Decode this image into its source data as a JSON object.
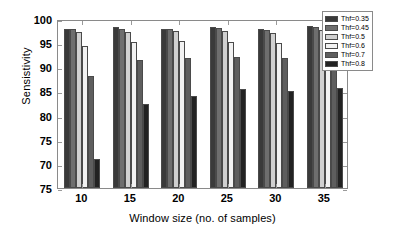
{
  "chart_data": {
    "type": "bar",
    "title": "",
    "xlabel": "Window size (no. of samples)",
    "ylabel": "Sensistivity",
    "categories": [
      "10",
      "15",
      "20",
      "25",
      "30",
      "35"
    ],
    "ytick_labels": [
      "100",
      "95",
      "90",
      "85",
      "80",
      "75",
      "70",
      "75"
    ],
    "ytick_values": [
      100,
      95,
      90,
      85,
      80,
      75,
      70,
      65
    ],
    "ylim": [
      65,
      100
    ],
    "grid": false,
    "legend_position": "top-right",
    "series": [
      {
        "name": "Thf=0.35",
        "color": "#3a3a3a",
        "values": [
          98.0,
          98.3,
          98.0,
          98.3,
          98.0,
          98.6
        ]
      },
      {
        "name": "Thf=0.45",
        "color": "#6e6e6e",
        "values": [
          98.0,
          98.0,
          98.0,
          98.2,
          97.8,
          98.3
        ]
      },
      {
        "name": "Thf=0.5",
        "color": "#d0d0d0",
        "values": [
          97.3,
          97.3,
          97.5,
          97.6,
          97.2,
          97.8
        ]
      },
      {
        "name": "Thf=0.6",
        "color": "#f2f2f2",
        "values": [
          94.5,
          95.3,
          95.5,
          95.3,
          95.0,
          95.8
        ]
      },
      {
        "name": "Thf=0.7",
        "color": "#5e5e5e",
        "values": [
          88.1,
          91.5,
          92.0,
          92.2,
          92.0,
          92.0
        ]
      },
      {
        "name": "Thf=0.8",
        "color": "#222222",
        "values": [
          71.1,
          82.4,
          84.0,
          85.6,
          85.0,
          85.8
        ]
      }
    ]
  }
}
